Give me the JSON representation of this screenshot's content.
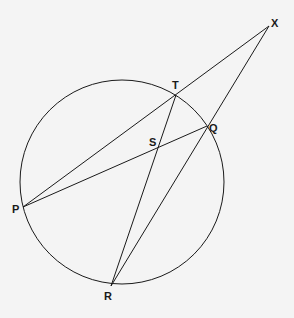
{
  "diagram": {
    "type": "circle-geometry",
    "circle": {
      "cx": 122,
      "cy": 182,
      "r": 102
    },
    "points": {
      "X": {
        "x": 269,
        "y": 26,
        "label": "X",
        "lx": 271,
        "ly": 27
      },
      "T": {
        "x": 176,
        "y": 95,
        "label": "T",
        "lx": 172,
        "ly": 89
      },
      "Q": {
        "x": 207,
        "y": 126,
        "label": "Q",
        "lx": 209,
        "ly": 132
      },
      "S": {
        "x": 157,
        "y": 147,
        "label": "S",
        "lx": 149,
        "ly": 146
      },
      "P": {
        "x": 23,
        "y": 207,
        "label": "P",
        "lx": 12,
        "ly": 213
      },
      "R": {
        "x": 111,
        "y": 286,
        "label": "R",
        "lx": 104,
        "ly": 300
      }
    },
    "segments": [
      [
        "P",
        "X"
      ],
      [
        "P",
        "Q"
      ],
      [
        "R",
        "T"
      ],
      [
        "R",
        "X"
      ]
    ],
    "stroke_color": "#1a1a1a"
  }
}
